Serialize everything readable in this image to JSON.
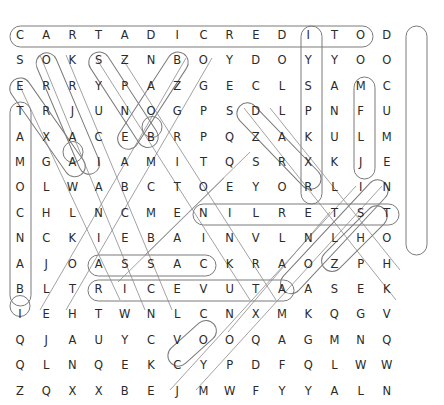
{
  "puzzle": {
    "type": "word-search",
    "title": "Word search grid",
    "rows": 15,
    "cols": 17,
    "cell_width": 26.2,
    "cell_height": 25.4,
    "origin_x": 9,
    "origin_y": 24,
    "letter_color": "#2b2b2b",
    "highlight_color": "#6b6b6b",
    "background_color": "#ffffff",
    "grid": [
      [
        "C",
        "A",
        "R",
        "T",
        "A",
        "D",
        "I",
        "C",
        "R",
        "E",
        "D",
        "I",
        "T",
        "O",
        "D"
      ],
      [
        "S",
        "O",
        "K",
        "S",
        "Z",
        "N",
        "B",
        "O",
        "Y",
        "D",
        "O",
        "Y",
        "Y",
        "O",
        "O"
      ],
      [
        "E",
        "R",
        "R",
        "Y",
        "P",
        "A",
        "Z",
        "G",
        "E",
        "C",
        "L",
        "S",
        "A",
        "M",
        "C"
      ],
      [
        "T",
        "R",
        "J",
        "U",
        "N",
        "O",
        "G",
        "P",
        "S",
        "D",
        "L",
        "P",
        "N",
        "F",
        "U"
      ],
      [
        "A",
        "X",
        "A",
        "C",
        "E",
        "B",
        "R",
        "P",
        "Q",
        "Z",
        "A",
        "K",
        "U",
        "L",
        "M"
      ],
      [
        "M",
        "G",
        "A",
        "I",
        "A",
        "M",
        "I",
        "T",
        "Q",
        "S",
        "R",
        "X",
        "K",
        "J",
        "E"
      ],
      [
        "O",
        "L",
        "W",
        "A",
        "B",
        "C",
        "T",
        "O",
        "E",
        "Y",
        "O",
        "R",
        "L",
        "I",
        "N"
      ],
      [
        "C",
        "H",
        "L",
        "N",
        "C",
        "M",
        "E",
        "N",
        "I",
        "L",
        "R",
        "E",
        "T",
        "S",
        "T"
      ],
      [
        "N",
        "C",
        "K",
        "I",
        "E",
        "B",
        "A",
        "I",
        "N",
        "V",
        "L",
        "N",
        "L",
        "H",
        "O"
      ],
      [
        "A",
        "J",
        "O",
        "A",
        "S",
        "S",
        "A",
        "C",
        "K",
        "R",
        "A",
        "O",
        "Z",
        "P",
        "H"
      ],
      [
        "B",
        "L",
        "T",
        "R",
        "I",
        "C",
        "E",
        "V",
        "U",
        "T",
        "A",
        "A",
        "S",
        "E",
        "K"
      ],
      [
        "I",
        "E",
        "H",
        "T",
        "W",
        "N",
        "L",
        "C",
        "N",
        "X",
        "M",
        "K",
        "Q",
        "G",
        "V"
      ],
      [
        "Q",
        "J",
        "A",
        "U",
        "Y",
        "C",
        "V",
        "O",
        "O",
        "Q",
        "A",
        "G",
        "M",
        "N",
        "Q"
      ],
      [
        "Q",
        "L",
        "N",
        "Q",
        "E",
        "K",
        "C",
        "Y",
        "P",
        "D",
        "F",
        "Q",
        "L",
        "W",
        "W"
      ],
      [
        "Z",
        "Q",
        "X",
        "X",
        "B",
        "E",
        "J",
        "M",
        "W",
        "F",
        "Y",
        "Y",
        "A",
        "L",
        "N"
      ]
    ],
    "found_words": [
      {
        "label": "CARTA DI CREDITO",
        "shape": "horizontal",
        "start_row": 0,
        "start_col": 0,
        "end_row": 0,
        "end_col": 13
      },
      {
        "label": "DOCUMENTO",
        "shape": "vertical",
        "start_row": 0,
        "start_col": 14,
        "end_row": 8,
        "end_col": 14
      },
      {
        "label": "DOLLARO",
        "shape": "vertical",
        "start_row": 0,
        "start_col": 10,
        "end_row": 6,
        "end_col": 10
      },
      {
        "label": "ANUK",
        "shape": "vertical",
        "start_row": 2,
        "start_col": 12,
        "end_row": 5,
        "end_col": 12
      },
      {
        "label": "TAMOCNAB",
        "shape": "vertical",
        "start_row": 3,
        "start_col": 0,
        "end_row": 10,
        "end_col": 0
      },
      {
        "label": "STERLINE",
        "shape": "horizontal",
        "start_row": 7,
        "start_col": 6,
        "end_row": 7,
        "end_col": 13
      },
      {
        "label": "ASSAC",
        "shape": "horizontal",
        "start_row": 9,
        "start_col": 3,
        "end_row": 9,
        "end_col": 7
      },
      {
        "label": "RICEVUTA",
        "shape": "horizontal",
        "start_row": 10,
        "start_col": 3,
        "end_row": 10,
        "end_col": 10
      },
      {
        "label": "diag-OBANCO",
        "shape": "diagonal",
        "start_row": 1,
        "start_col": 1,
        "end_row": 5,
        "end_col": 2
      },
      {
        "label": "diag-SACE",
        "shape": "diagonal",
        "start_row": 1,
        "start_col": 3,
        "end_row": 4,
        "end_col": 4
      },
      {
        "label": "diag-BANCA",
        "shape": "diagonal",
        "start_row": 1,
        "start_col": 6,
        "end_row": 4,
        "end_col": 3
      },
      {
        "label": "diag-ERIBA",
        "shape": "diagonal",
        "start_row": 2,
        "start_col": 0,
        "end_row": 5,
        "end_col": 2
      },
      {
        "label": "diag-SOQEI",
        "shape": "diagonal",
        "start_row": 3,
        "start_col": 8,
        "end_row": 6,
        "end_col": 13
      },
      {
        "label": "diag-OITSE",
        "shape": "diagonal",
        "start_row": 6,
        "start_col": 13,
        "end_row": 10,
        "end_col": 9
      },
      {
        "label": "diag-RAO",
        "shape": "diagonal",
        "start_row": 7,
        "start_col": 13,
        "end_row": 9,
        "end_col": 11
      },
      {
        "label": "diag-IBLT",
        "shape": "diagonal",
        "start_row": 11,
        "start_col": 0,
        "end_row": 8,
        "end_col": 3
      },
      {
        "label": "diag-CYO",
        "shape": "diagonal",
        "start_row": 13,
        "start_col": 6,
        "end_row": 12,
        "end_col": 8
      },
      {
        "label": "diag-long-left",
        "shape": "diagonal",
        "start_row": 10,
        "start_col": 1,
        "end_row": 2,
        "end_col": 7
      }
    ]
  }
}
